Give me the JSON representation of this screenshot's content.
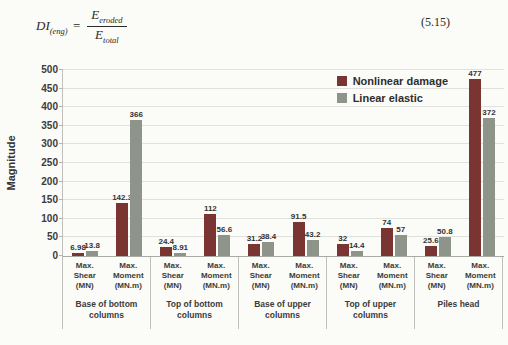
{
  "equation": {
    "lhs_base": "DI",
    "lhs_sub": "(eng)",
    "equals": "=",
    "numerator_base": "E",
    "numerator_sub": "eroded",
    "denominator_base": "E",
    "denominator_sub": "total",
    "number": "(5.15)"
  },
  "chart_data": {
    "type": "bar",
    "title": "",
    "xlabel": "",
    "ylabel": "Magnitude",
    "ylim": [
      0,
      500
    ],
    "ytick_step": 50,
    "grid": true,
    "legend_position": "top-right-inside",
    "series": [
      {
        "name": "Nonlinear damage",
        "color": "#7a3432"
      },
      {
        "name": "Linear elastic",
        "color": "#8e9489"
      }
    ],
    "groups": [
      {
        "label": "Base of bottom columns",
        "subs": [
          {
            "label": "Max. Shear (MN)",
            "values": [
              6.98,
              13.8
            ]
          },
          {
            "label": "Max. Moment (MN.m)",
            "values": [
              142.3,
              366
            ]
          }
        ]
      },
      {
        "label": "Top of bottom columns",
        "subs": [
          {
            "label": "Max. Shear (MN)",
            "values": [
              24.4,
              8.91
            ]
          },
          {
            "label": "Max. Moment (MN.m)",
            "values": [
              112,
              56.6
            ]
          }
        ]
      },
      {
        "label": "Base of upper columns",
        "subs": [
          {
            "label": "Max. Shear (MN)",
            "values": [
              31.2,
              38.4
            ]
          },
          {
            "label": "Max. Moment (MN.m)",
            "values": [
              91.5,
              43.2
            ]
          }
        ]
      },
      {
        "label": "Top of upper columns",
        "subs": [
          {
            "label": "Max. Shear (MN)",
            "values": [
              32,
              14.4
            ]
          },
          {
            "label": "Max. Moment (MN.m)",
            "values": [
              74,
              57
            ]
          }
        ]
      },
      {
        "label": "Piles head",
        "subs": [
          {
            "label": "Max. Shear (MN)",
            "values": [
              25.6,
              50.8
            ]
          },
          {
            "label": "Max. Moment (MN.m)",
            "values": [
              477,
              372
            ]
          }
        ]
      }
    ]
  }
}
